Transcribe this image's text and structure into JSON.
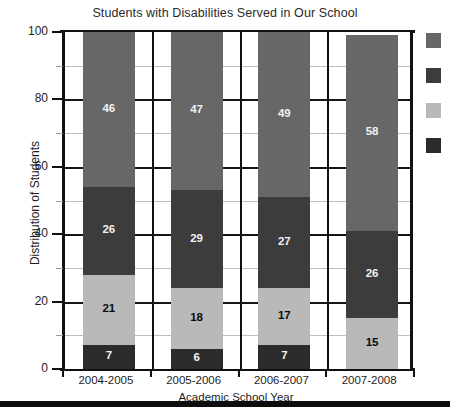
{
  "chart_data": {
    "type": "bar",
    "subtype": "stacked-column",
    "title": "Students with Disabilities Served in Our School",
    "xlabel": "Academic School Year",
    "ylabel": "Distribution of  Students",
    "categories": [
      "2004-2005",
      "2005-2006",
      "2006-2007",
      "2007-2008"
    ],
    "ylim": [
      0,
      100
    ],
    "yticks": [
      0,
      20,
      40,
      60,
      80,
      100
    ],
    "ytick_labels": [
      "0",
      "20",
      "40",
      "60",
      "80",
      "100"
    ],
    "yminor_ticks": [
      10,
      30,
      50,
      70,
      90
    ],
    "grid": "horizontal major black, horizontal minor light gray",
    "legend_position": "right",
    "legend_has_labels": false,
    "series": [
      {
        "name": "series-1",
        "color": "#2b2b2b",
        "values": [
          7,
          6,
          7,
          0
        ]
      },
      {
        "name": "series-2",
        "color": "#b9b9b9",
        "values": [
          21,
          18,
          17,
          15
        ]
      },
      {
        "name": "series-3",
        "color": "#3c3c3c",
        "values": [
          26,
          29,
          27,
          26
        ]
      },
      {
        "name": "series-4",
        "color": "#676767",
        "values": [
          46,
          47,
          49,
          58
        ]
      }
    ],
    "stack_order_bottom_to_top": [
      "series-1",
      "series-2",
      "series-3",
      "series-4"
    ],
    "data_labels_visible": true,
    "hidden_zero_labels": true
  },
  "legend": {
    "swatches": [
      {
        "name": "legend-swatch-1",
        "color": "#676767"
      },
      {
        "name": "legend-swatch-2",
        "color": "#3c3c3c"
      },
      {
        "name": "legend-swatch-3",
        "color": "#b9b9b9"
      },
      {
        "name": "legend-swatch-4",
        "color": "#2b2b2b"
      }
    ]
  },
  "colors": {
    "axis": "#111111",
    "grid_major": "#151515",
    "grid_minor": "#bdbdbd",
    "background": "#ffffff",
    "text": "#1d1d1d"
  }
}
